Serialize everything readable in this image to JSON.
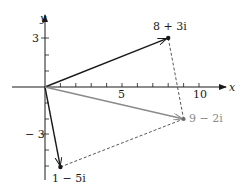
{
  "diagram": {
    "axes": {
      "x_label": "x",
      "y_label": "y",
      "x_tick_labels": [
        "5",
        "10"
      ],
      "y_tick_labels": [
        "3",
        "− 3"
      ]
    },
    "points": [
      {
        "label": "8 + 3i",
        "re": 8,
        "im": 3,
        "color": "#1a1a1a"
      },
      {
        "label": "1 − 5i",
        "re": 1,
        "im": -5,
        "color": "#1a1a1a"
      },
      {
        "label": "9 − 2i",
        "re": 9,
        "im": -2,
        "color": "#8a8a8a"
      }
    ],
    "colors": {
      "axis": "#1a1a1a",
      "vector": "#1a1a1a",
      "sum_vector": "#8a8a8a",
      "dashed": "#444444"
    }
  }
}
